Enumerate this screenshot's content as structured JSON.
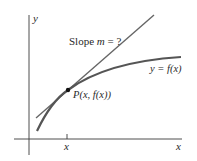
{
  "diagram": {
    "colors": {
      "axis": "#3a3a3a",
      "curve": "#555555",
      "tangent": "#666666",
      "point": "#111111",
      "text": "#2a2a2a"
    },
    "labels": {
      "y_axis": "y",
      "x_axis": "x",
      "x_tick": "x",
      "slope": "Slope m = ?",
      "slope_prefix": "Slope ",
      "slope_var": "m",
      "slope_suffix": " = ?",
      "curve": "y = f(x)",
      "point": "P(x, f(x))"
    },
    "elements": {
      "curve_name": "y = f(x)",
      "tangent_line": "tangent at P",
      "point_name": "P"
    }
  }
}
